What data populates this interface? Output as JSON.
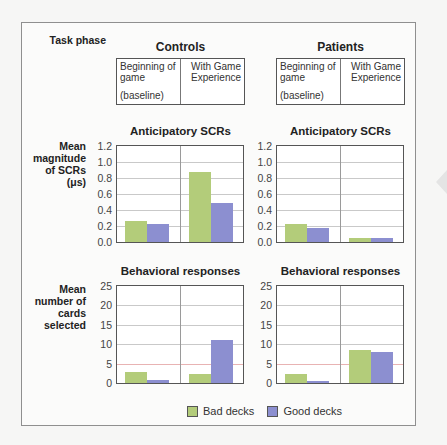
{
  "header": {
    "row_label": "Task phase",
    "groups": [
      {
        "title": "Controls",
        "phases": [
          "Beginning of game",
          "With Game Experience"
        ],
        "baseline_note": "(baseline)"
      },
      {
        "title": "Patients",
        "phases": [
          "Beginning of game",
          "With Game Experience"
        ],
        "baseline_note": "(baseline)"
      }
    ]
  },
  "row_labels": {
    "scr": "Mean magnitude of SCRs (μs)",
    "behavior": "Mean number of cards selected"
  },
  "legend": {
    "bad": "Bad decks",
    "good": "Good decks"
  },
  "colors": {
    "bad": "#b3cc7a",
    "good": "#8c8fd0",
    "frame": "#8f8f8f"
  },
  "chart_data": [
    {
      "type": "bar",
      "group": "Controls",
      "title": "Anticipatory SCRs",
      "ylabel": "Mean magnitude of SCRs (μs)",
      "categories": [
        "Beginning of game (baseline)",
        "With Game Experience"
      ],
      "series": [
        {
          "name": "Bad decks",
          "values": [
            0.26,
            0.87
          ]
        },
        {
          "name": "Good decks",
          "values": [
            0.22,
            0.49
          ]
        }
      ],
      "ylim": [
        0,
        1.2
      ],
      "yticks": [
        "0.0",
        "0.2",
        "0.4",
        "0.6",
        "0.8",
        "1.0",
        "1.2"
      ],
      "grid": true,
      "legend_position": "bottom"
    },
    {
      "type": "bar",
      "group": "Patients",
      "title": "Anticipatory SCRs",
      "ylabel": "Mean magnitude of SCRs (μs)",
      "categories": [
        "Beginning of game (baseline)",
        "With Game Experience"
      ],
      "series": [
        {
          "name": "Bad decks",
          "values": [
            0.22,
            0.05
          ]
        },
        {
          "name": "Good decks",
          "values": [
            0.18,
            0.05
          ]
        }
      ],
      "ylim": [
        0,
        1.2
      ],
      "yticks": [
        "0.0",
        "0.2",
        "0.4",
        "0.6",
        "0.8",
        "1.0",
        "1.2"
      ],
      "grid": true,
      "legend_position": "bottom"
    },
    {
      "type": "bar",
      "group": "Controls",
      "title": "Behavioral responses",
      "ylabel": "Mean number of cards selected",
      "categories": [
        "Beginning of game (baseline)",
        "With Game Experience"
      ],
      "series": [
        {
          "name": "Bad decks",
          "values": [
            2.8,
            2.4
          ]
        },
        {
          "name": "Good decks",
          "values": [
            0.8,
            11.0
          ]
        }
      ],
      "ylim": [
        0,
        25
      ],
      "yticks": [
        "0",
        "5",
        "10",
        "15",
        "20",
        "25"
      ],
      "grid": true,
      "legend_position": "bottom"
    },
    {
      "type": "bar",
      "group": "Patients",
      "title": "Behavioral responses",
      "ylabel": "Mean number of cards selected",
      "categories": [
        "Beginning of game (baseline)",
        "With Game Experience"
      ],
      "series": [
        {
          "name": "Bad decks",
          "values": [
            2.2,
            8.6
          ]
        },
        {
          "name": "Good decks",
          "values": [
            0.6,
            7.9
          ]
        }
      ],
      "ylim": [
        0,
        25
      ],
      "yticks": [
        "0",
        "5",
        "10",
        "15",
        "20",
        "25"
      ],
      "grid": true,
      "legend_position": "bottom"
    }
  ]
}
